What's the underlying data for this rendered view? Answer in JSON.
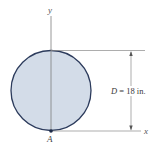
{
  "figure": {
    "shape": "circle",
    "axes": {
      "x_label": "x",
      "y_label": "y"
    },
    "point_label": "A",
    "dimension": {
      "symbol": "D",
      "equals": "=",
      "value": "18 in.",
      "full_text": "D = 18 in."
    },
    "colors": {
      "fill": "#d3dce8",
      "stroke": "#2c3b5c",
      "lines": "#8a8a8a",
      "text": "#3a3a3a"
    }
  }
}
